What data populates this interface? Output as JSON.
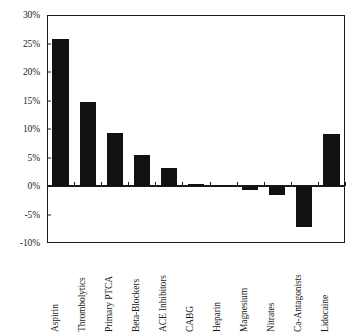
{
  "chart_data": {
    "type": "bar",
    "title": "",
    "subtitle": "",
    "xlabel": "",
    "ylabel": "",
    "categories": [
      "Aspirin",
      "Thrombolytics",
      "Primary PTCA",
      "Beta-Blockers",
      "ACE Inhibitors",
      "CABG",
      "Heparin",
      "Magnesium",
      "Nitrates",
      "Ca-Antagonists",
      "Lidocaine"
    ],
    "values": [
      25.8,
      14.8,
      9.3,
      5.5,
      3.1,
      0.4,
      0.0,
      -0.7,
      -1.5,
      -7.2,
      9.1
    ],
    "value_labels": [
      "25.8%",
      "14.8%",
      "9.3%",
      "5.5%",
      "3.1%",
      "0.4%",
      "0%",
      "-0.7%",
      "-1.5%",
      "-7.2%",
      "9.1%"
    ],
    "ylim": [
      -10,
      30
    ],
    "ytick_values": [
      30,
      25,
      20,
      15,
      10,
      5,
      0,
      -5,
      -10
    ],
    "ytick_labels": [
      "30%",
      "25%",
      "20%",
      "15%",
      "10%",
      "5%",
      "0%",
      "-5%",
      "-10%"
    ],
    "grid": false,
    "legend": null,
    "legend_position": "none",
    "bar_color": "#111111",
    "axis_color": "#1b1b1b",
    "background_color": "#ffffff",
    "zero_line": true
  },
  "caption": {
    "partial_text": ""
  }
}
